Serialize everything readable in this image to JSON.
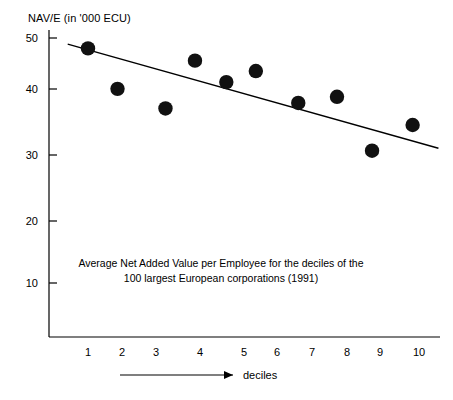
{
  "chart_data": {
    "type": "scatter",
    "title": "",
    "caption_line1": "Average Net Added Value per Employee for the deciles of the",
    "caption_line2": "100 largest European corporations (1991)",
    "ylabel": "NAV/E (in '000 ECU)",
    "xlabel": "deciles",
    "x": [
      1.0,
      1.8,
      3.1,
      3.9,
      4.75,
      5.55,
      6.7,
      7.75,
      8.7,
      9.8
    ],
    "values": [
      48.3,
      41.7,
      38.5,
      46.3,
      42.8,
      44.6,
      39.4,
      40.4,
      31.6,
      35.8
    ],
    "categories": [
      "1",
      "2",
      "3",
      "4",
      "5",
      "6",
      "7",
      "8",
      "9",
      "10"
    ],
    "xticks": [
      1,
      2,
      3,
      4,
      5,
      6,
      7,
      8,
      9,
      10
    ],
    "yticks": [
      10,
      20,
      30,
      40,
      50
    ],
    "xlim": [
      0.3,
      10.6
    ],
    "ylim": [
      0,
      52
    ],
    "grid": false,
    "legend": false,
    "trendline": {
      "x1": 0.45,
      "y1": 49.0,
      "x2": 10.5,
      "y2": 32.0,
      "label": "regression-line"
    },
    "marker_color": "#111111",
    "axis_color": "#000000"
  },
  "yticklabels": [
    "50",
    "40",
    "30",
    "20",
    "10"
  ],
  "xticklabels": [
    "1",
    "2",
    "3",
    "4",
    "5",
    "6",
    "7",
    "8",
    "9",
    "10"
  ],
  "arrow": {
    "name": "x-direction-arrow"
  }
}
